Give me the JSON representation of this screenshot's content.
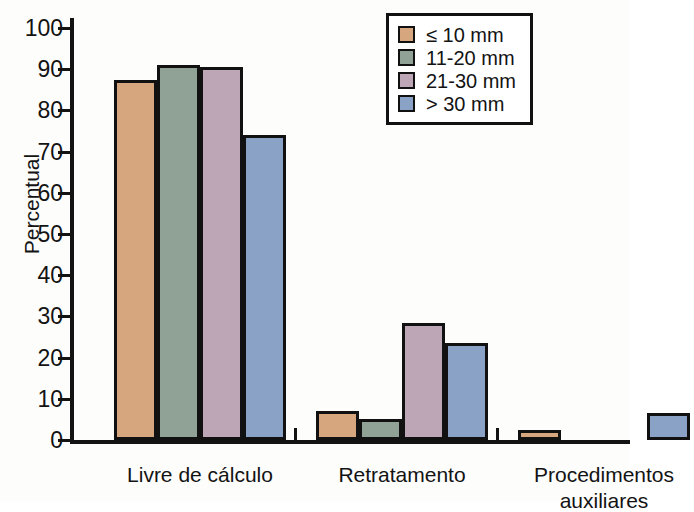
{
  "chart_data": {
    "type": "bar",
    "title": "",
    "xlabel": "",
    "ylabel": "Percentual",
    "ylim": [
      0,
      100
    ],
    "yticks": [
      0,
      10,
      20,
      30,
      40,
      50,
      60,
      70,
      80,
      90,
      100
    ],
    "ytick_labels": [
      "0",
      "10",
      "20",
      "30",
      "40",
      "50",
      "60",
      "70",
      "80",
      "90",
      "100"
    ],
    "grid": false,
    "legend_position": "upper right",
    "categories": [
      "Livre de cálculo",
      "Retratamento",
      "Procedimentos auxiliares"
    ],
    "category_labels_display": [
      "Livre de cálculo",
      "Retratamento",
      "Procedimentos\nauxiliares"
    ],
    "series": [
      {
        "name": "≤ 10 mm",
        "color": "#d6a77f",
        "values": [
          87.5,
          7.0,
          2.5
        ]
      },
      {
        "name": "11-20 mm",
        "color": "#8fa295",
        "values": [
          91.0,
          5.0,
          0.0
        ]
      },
      {
        "name": "21-30 mm",
        "color": "#bda7b7",
        "values": [
          90.5,
          28.5,
          0.0
        ]
      },
      {
        "name": "> 30 mm",
        "color": "#8aa2c6",
        "values": [
          74.0,
          23.5,
          6.5
        ]
      }
    ]
  },
  "legend": {
    "entries": [
      {
        "label": "≤ 10 mm"
      },
      {
        "label": "11-20 mm"
      },
      {
        "label": "21-30 mm"
      },
      {
        "label": "> 30 mm"
      }
    ]
  },
  "axis": {
    "y_title": "Percentual"
  }
}
